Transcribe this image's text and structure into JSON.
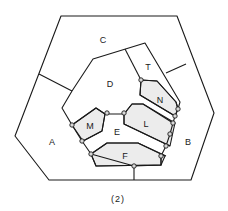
{
  "caption": "(2)",
  "regions": [
    {
      "id": "A",
      "label": "A",
      "x": 52,
      "y": 142
    },
    {
      "id": "B",
      "label": "B",
      "x": 188,
      "y": 142
    },
    {
      "id": "C",
      "label": "C",
      "x": 103,
      "y": 40
    },
    {
      "id": "D",
      "label": "D",
      "x": 110,
      "y": 84
    },
    {
      "id": "T",
      "label": "T",
      "x": 148,
      "y": 67
    },
    {
      "id": "N",
      "label": "N",
      "x": 160,
      "y": 100
    },
    {
      "id": "M",
      "label": "M",
      "x": 90,
      "y": 126
    },
    {
      "id": "E",
      "label": "E",
      "x": 117,
      "y": 132
    },
    {
      "id": "L",
      "label": "L",
      "x": 146,
      "y": 124
    },
    {
      "id": "F",
      "label": "F",
      "x": 125,
      "y": 156
    }
  ],
  "shaded_regions": [
    "M",
    "N",
    "L",
    "F"
  ],
  "node_count": 14
}
